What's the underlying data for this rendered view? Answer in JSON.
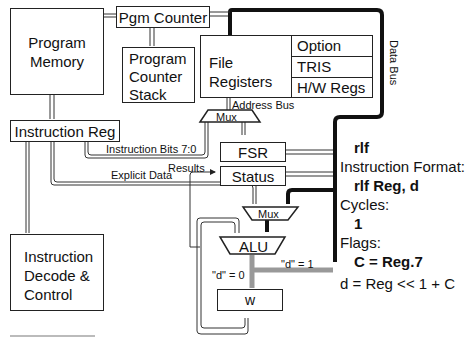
{
  "blocks": {
    "program_memory": [
      "Program",
      "Memory"
    ],
    "pgm_counter": "Pgm Counter",
    "pc_stack": [
      "Program",
      "Counter",
      "Stack"
    ],
    "file_registers": [
      "File",
      "Registers"
    ],
    "special_regs": [
      "Option",
      "TRIS",
      "H/W Regs"
    ],
    "instruction_reg": "Instruction Reg",
    "decode": [
      "Instruction",
      "Decode &",
      "Control"
    ],
    "fsr": "FSR",
    "status": "Status",
    "mux_addr": "Mux",
    "mux_alu": "Mux",
    "alu": "ALU",
    "w": "w"
  },
  "signals": {
    "data_bus": "Data Bus",
    "address_bus": "Address Bus",
    "instruction_bits": "Instruction Bits 7:0",
    "results": "Results",
    "explicit_data": "Explicit Data",
    "d0": "\"d\" = 0",
    "d1": "\"d\" = 1"
  },
  "instruction_info": {
    "mnemonic": "rlf",
    "format_label": "Instruction Format:",
    "format": "rlf Reg, d",
    "cycles_label": "Cycles:",
    "cycles": "1",
    "flags_label": "Flags:",
    "flags": "C = Reg.7",
    "operation": "d = Reg << 1 + C"
  }
}
